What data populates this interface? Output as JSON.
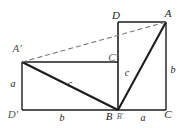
{
  "figure": {
    "stroke_color": "#1d1d1d",
    "dashed_color": "#7a7a7a",
    "background": "#ffffff",
    "vertices": [
      {
        "id": "D",
        "label": "D",
        "x": 116,
        "y": 15
      },
      {
        "id": "A",
        "label": "A",
        "x": 168,
        "y": 13
      },
      {
        "id": "Aprime",
        "label": "A'",
        "x": 17,
        "y": 48
      },
      {
        "id": "Cprime",
        "label": "C'",
        "x": 113,
        "y": 57
      },
      {
        "id": "Dprime",
        "label": "D'",
        "x": 13,
        "y": 114
      },
      {
        "id": "B",
        "label": "B",
        "x": 109,
        "y": 114
      },
      {
        "id": "Bprime",
        "label": "B'",
        "x": 120,
        "y": 116
      },
      {
        "id": "C",
        "label": "C",
        "x": 168,
        "y": 114
      }
    ],
    "sides": [
      {
        "id": "side-a-left",
        "label": "a",
        "x": 13,
        "y": 84
      },
      {
        "id": "side-b-bottom",
        "label": "b",
        "x": 62,
        "y": 117
      },
      {
        "id": "side-a-bottom",
        "label": "a",
        "x": 143,
        "y": 117
      },
      {
        "id": "side-b-right",
        "label": "b",
        "x": 172,
        "y": 70
      },
      {
        "id": "side-c-hyp-left",
        "label": "c",
        "x": 70,
        "y": 83
      },
      {
        "id": "side-c-hyp-right",
        "label": "c",
        "x": 126,
        "y": 72
      }
    ]
  }
}
